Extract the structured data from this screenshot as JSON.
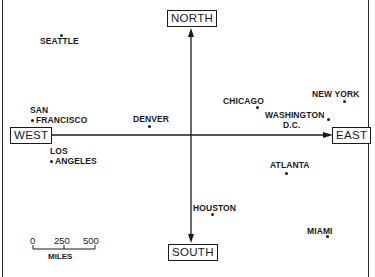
{
  "directions": {
    "north": "NORTH",
    "south": "SOUTH",
    "east": "EAST",
    "west": "WEST"
  },
  "cities": [
    {
      "name": "SEATTLE",
      "label_lines": [
        "SEATTLE"
      ]
    },
    {
      "name": "SAN FRANCISCO",
      "label_lines": [
        "SAN",
        "FRANCISCO"
      ]
    },
    {
      "name": "LOS ANGELES",
      "label_lines": [
        "LOS",
        "ANGELES"
      ]
    },
    {
      "name": "DENVER",
      "label_lines": [
        "DENVER"
      ]
    },
    {
      "name": "CHICAGO",
      "label_lines": [
        "CHICAGO"
      ]
    },
    {
      "name": "NEW YORK",
      "label_lines": [
        "NEW YORK"
      ]
    },
    {
      "name": "WASHINGTON D.C.",
      "label_lines": [
        "WASHINGTON",
        "D.C."
      ]
    },
    {
      "name": "ATLANTA",
      "label_lines": [
        "ATLANTA"
      ]
    },
    {
      "name": "HOUSTON",
      "label_lines": [
        "HOUSTON"
      ]
    },
    {
      "name": "MIAMI",
      "label_lines": [
        "MIAMI"
      ]
    }
  ],
  "scale_bar": {
    "ticks": [
      "0",
      "250",
      "500"
    ],
    "unit": "MILES"
  }
}
